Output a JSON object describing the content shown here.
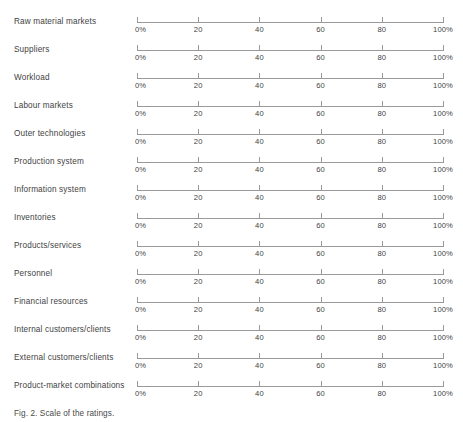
{
  "figure": {
    "caption": "Fig. 2. Scale of the ratings.",
    "line_color": "#9a9a9a",
    "text_color": "#3f3f3f",
    "background_color": "#ffffff"
  },
  "chart_data": {
    "type": "table",
    "title": "",
    "subtitle": "",
    "xlabel": "",
    "ylabel": "",
    "xlim": [
      0,
      100
    ],
    "grid": false,
    "legend": "none",
    "axis_ticks": [
      {
        "value": 0,
        "label": "0%"
      },
      {
        "value": 20,
        "label": "20"
      },
      {
        "value": 40,
        "label": "40"
      },
      {
        "value": 60,
        "label": "60"
      },
      {
        "value": 80,
        "label": "80"
      },
      {
        "value": 100,
        "label": "100%"
      }
    ],
    "categories": [
      "Raw material markets",
      "Suppliers",
      "Workload",
      "Labour markets",
      "Outer technologies",
      "Production system",
      "Information system",
      "Inventories",
      "Products/services",
      "Personnel",
      "Financial resources",
      "Internal customers/clients",
      "External customers/clients",
      "Product-market combinations"
    ],
    "values": [
      null,
      null,
      null,
      null,
      null,
      null,
      null,
      null,
      null,
      null,
      null,
      null,
      null,
      null
    ],
    "rows": [
      {
        "label": "Raw material markets",
        "value": null
      },
      {
        "label": "Suppliers",
        "value": null
      },
      {
        "label": "Workload",
        "value": null
      },
      {
        "label": "Labour markets",
        "value": null
      },
      {
        "label": "Outer technologies",
        "value": null
      },
      {
        "label": "Production system",
        "value": null
      },
      {
        "label": "Information system",
        "value": null
      },
      {
        "label": "Inventories",
        "value": null
      },
      {
        "label": "Products/services",
        "value": null
      },
      {
        "label": "Personnel",
        "value": null
      },
      {
        "label": "Financial resources",
        "value": null
      },
      {
        "label": "Internal customers/clients",
        "value": null
      },
      {
        "label": "External customers/clients",
        "value": null
      },
      {
        "label": "Product-market combinations",
        "value": null
      }
    ]
  }
}
